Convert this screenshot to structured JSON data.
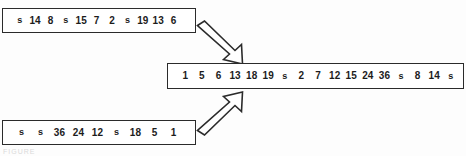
{
  "figure": {
    "kind": "merge-diagram",
    "background_color": "#fdfdfd",
    "ink_color": "#2b2b2b",
    "sentinel_symbol": "s"
  },
  "runs": {
    "top": {
      "label": "top-input-run",
      "items": [
        "s",
        "14",
        "8",
        "s",
        "15",
        "7",
        "2",
        "s",
        "19",
        "13",
        "6"
      ]
    },
    "bottom": {
      "label": "bottom-input-run",
      "items": [
        "s",
        "s",
        "36",
        "24",
        "12",
        "s",
        "18",
        "5",
        "1"
      ]
    },
    "merged": {
      "label": "merged-output-run",
      "items": [
        "1",
        "5",
        "6",
        "13",
        "18",
        "19",
        "s",
        "2",
        "7",
        "12",
        "15",
        "24",
        "36",
        "s",
        "8",
        "14",
        "s"
      ]
    }
  },
  "arrows": [
    {
      "name": "arrow-top-to-merged",
      "direction": "down-right",
      "style": "hollow-outline"
    },
    {
      "name": "arrow-bottom-to-merged",
      "direction": "up-right",
      "style": "hollow-outline"
    }
  ],
  "caption": {
    "sliver_text": "FIGURE"
  }
}
